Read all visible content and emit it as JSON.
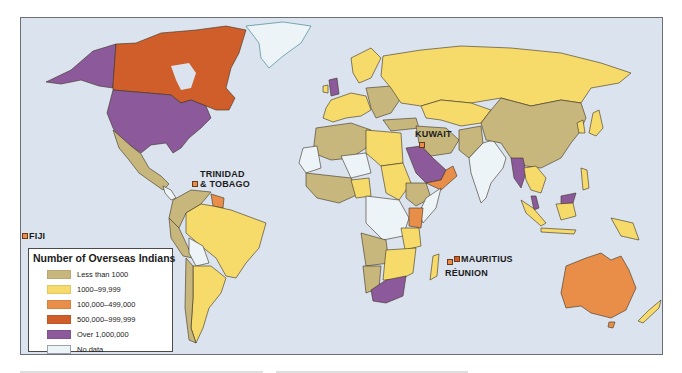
{
  "map": {
    "title": "Number of Overseas Indians",
    "colors": {
      "ocean": "#dbe3ee",
      "less_than_1000": "#c8b77d",
      "1000_99999": "#f6da6a",
      "100000_499999": "#e98e48",
      "500000_999999": "#cf5e2a",
      "over_1000000": "#8c5a9a",
      "no_data": "#edf4f8"
    },
    "legend": {
      "title": "Number of Overseas Indians",
      "items": [
        {
          "label": "Less than 1000",
          "color": "#c8b77d"
        },
        {
          "label": "1000–99,999",
          "color": "#f6da6a"
        },
        {
          "label": "100,000–499,000",
          "color": "#e98e48"
        },
        {
          "label": "500,000–999,999",
          "color": "#cf5e2a"
        },
        {
          "label": "Over 1,000,000",
          "color": "#8c5a9a"
        },
        {
          "label": "No data",
          "color": "#edf4f8"
        }
      ]
    },
    "callouts": [
      {
        "label": "FIJI",
        "category": "100,000–499,000"
      },
      {
        "label": "TRINIDAD",
        "label2": "& TOBAGO",
        "category": "100,000–499,000"
      },
      {
        "label": "KUWAIT",
        "category": "100,000–499,000"
      },
      {
        "label": "MAURITIUS",
        "category": "500,000–999,999"
      },
      {
        "label": "RÉUNION",
        "category": "100,000–499,000"
      }
    ],
    "regions": [
      {
        "name": "United States",
        "category": "Over 1,000,000"
      },
      {
        "name": "Canada",
        "category": "500,000–999,999"
      },
      {
        "name": "Greenland",
        "category": "No data"
      },
      {
        "name": "Mexico",
        "category": "Less than 1000"
      },
      {
        "name": "Brazil",
        "category": "1000–99,999"
      },
      {
        "name": "Argentina",
        "category": "1000–99,999"
      },
      {
        "name": "Bolivia",
        "category": "No data"
      },
      {
        "name": "Guyana/Suriname",
        "category": "100,000–499,000"
      },
      {
        "name": "United Kingdom",
        "category": "Over 1,000,000"
      },
      {
        "name": "Russia",
        "category": "1000–99,999"
      },
      {
        "name": "China",
        "category": "Less than 1000"
      },
      {
        "name": "India",
        "category": "No data"
      },
      {
        "name": "Saudi Arabia",
        "category": "Over 1,000,000"
      },
      {
        "name": "Oman/Yemen",
        "category": "100,000–499,000"
      },
      {
        "name": "Myanmar",
        "category": "Over 1,000,000"
      },
      {
        "name": "Malaysia",
        "category": "Over 1,000,000"
      },
      {
        "name": "South Africa",
        "category": "Over 1,000,000"
      },
      {
        "name": "Kenya",
        "category": "100,000–499,000"
      },
      {
        "name": "Madagascar",
        "category": "1000–99,999"
      },
      {
        "name": "Australia",
        "category": "100,000–499,000"
      },
      {
        "name": "New Zealand",
        "category": "1000–99,999"
      },
      {
        "name": "Japan",
        "category": "1000–99,999"
      }
    ]
  }
}
